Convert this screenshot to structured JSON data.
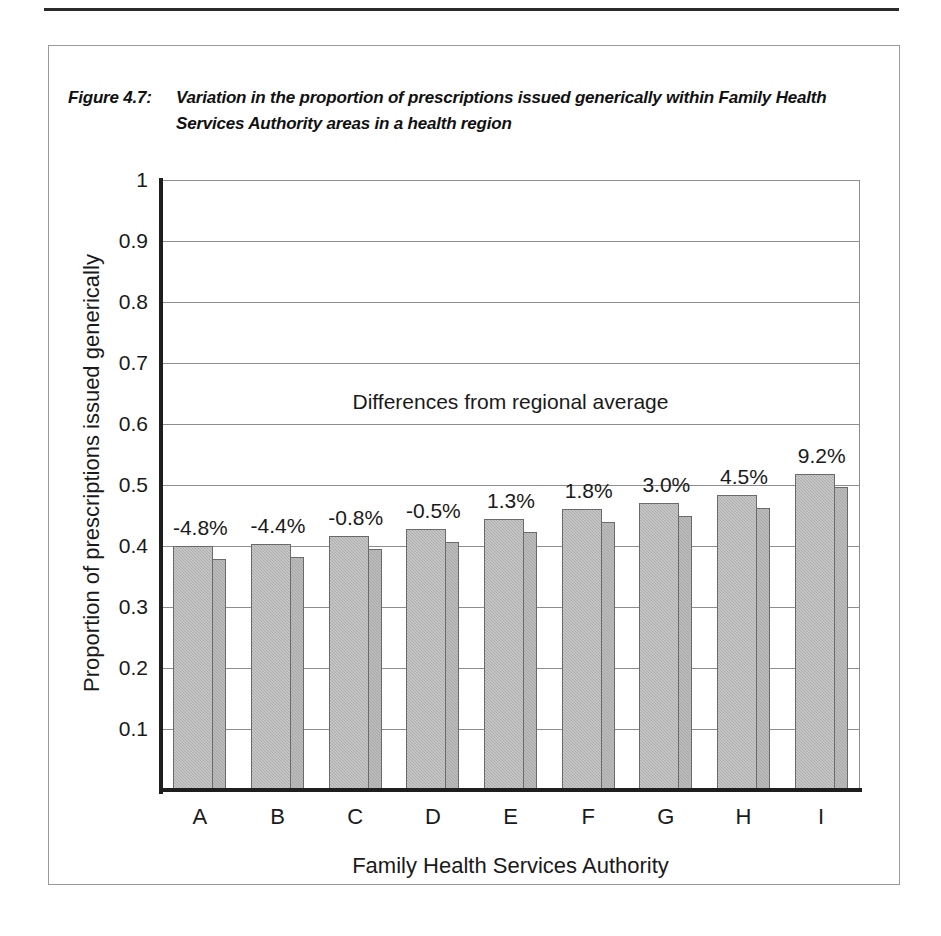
{
  "figure": {
    "number": "Figure 4.7:",
    "title": "Variation in the proportion of prescriptions issued generically within Family Health Services Authority areas in a health region"
  },
  "chart_data": {
    "type": "bar",
    "title": "Variation in the proportion of prescriptions issued generically within Family Health Services Authority areas in a health region",
    "xlabel": "Family Health Services Authority",
    "ylabel": "Proportion of prescriptions issued generically",
    "categories": [
      "A",
      "B",
      "C",
      "D",
      "E",
      "F",
      "G",
      "H",
      "I"
    ],
    "values": [
      0.4,
      0.404,
      0.416,
      0.428,
      0.444,
      0.46,
      0.47,
      0.484,
      0.518
    ],
    "data_labels": [
      "-4.8%",
      "-4.4%",
      "-0.8%",
      "-0.5%",
      "1.3%",
      "1.8%",
      "3.0%",
      "4.5%",
      "9.2%"
    ],
    "annotation": "Differences from regional average",
    "ylim": [
      0,
      1
    ],
    "y_ticks": [
      1,
      0.9,
      0.8,
      0.7,
      0.6,
      0.5,
      0.4,
      0.3,
      0.2,
      0.1
    ],
    "y_tick_labels": [
      "1",
      "0.9",
      "0.8",
      "0.7",
      "0.6",
      "0.5",
      "0.4",
      "0.3",
      "0.2",
      "0.1"
    ],
    "grid": true,
    "legend": "none",
    "bar_color": "#b2b2b2",
    "bar_edge_color": "#6a6a6a"
  }
}
